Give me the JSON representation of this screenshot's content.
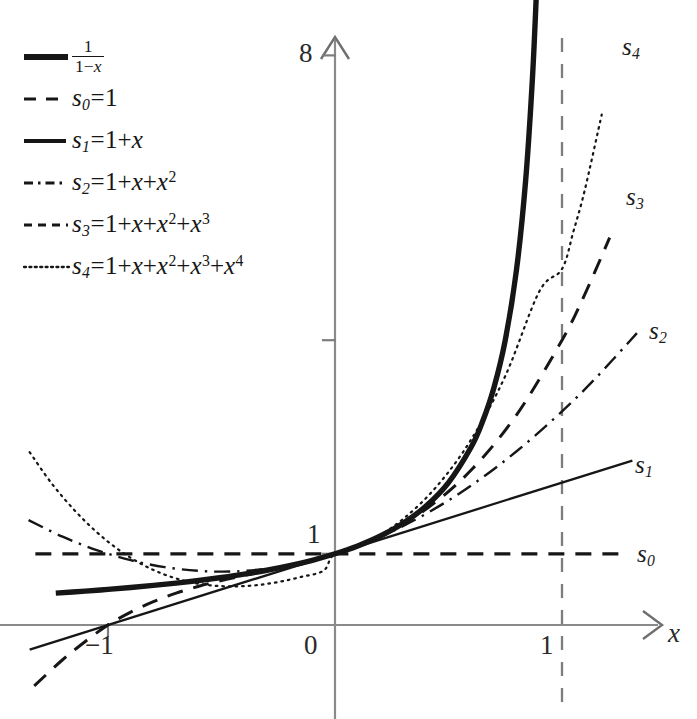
{
  "figure": {
    "title": "",
    "background": "#ffffff",
    "ink": "#161616",
    "axis_color": "#8a8a8a"
  },
  "legend": {
    "entries": [
      {
        "key": "f",
        "style": "solid-thick",
        "label_html": "<span class=\"frac\"><span class=\"num\">1</span><span class=\"den\">1&minus;<span class=\"mi\">x</span></span></span>"
      },
      {
        "key": "s0",
        "style": "dashed",
        "label_html": "<span class=\"mi\">s</span><span class=\"sub\">0</span><span class=\"eq\">=</span>1"
      },
      {
        "key": "s1",
        "style": "solid-thin",
        "label_html": "<span class=\"mi\">s</span><span class=\"sub\">1</span><span class=\"eq\">=</span>1+<span class=\"mi\">x</span>"
      },
      {
        "key": "s2",
        "style": "dashdot",
        "label_html": "<span class=\"mi\">s</span><span class=\"sub\">2</span><span class=\"eq\">=</span>1+<span class=\"mi\">x</span>+<span class=\"mi\">x</span><span class=\"sup\">2</span>"
      },
      {
        "key": "s3",
        "style": "dashed-short",
        "label_html": "<span class=\"mi\">s</span><span class=\"sub\">3</span><span class=\"eq\">=</span>1+<span class=\"mi\">x</span>+<span class=\"mi\">x</span><span class=\"sup\">2</span>+<span class=\"mi\">x</span><span class=\"sup\">3</span>"
      },
      {
        "key": "s4",
        "style": "dotted",
        "label_html": "<span class=\"mi\">s</span><span class=\"sub\">4</span><span class=\"eq\">=</span>1+<span class=\"mi\">x</span>+<span class=\"mi\">x</span><span class=\"sup\">2</span>+<span class=\"mi\">x</span><span class=\"sup\">3</span>+<span class=\"mi\">x</span><span class=\"sup\">4</span>"
      }
    ]
  },
  "axes": {
    "x_axis_label": "x",
    "y_tick_labels": [
      {
        "text": "8",
        "value": 8
      },
      {
        "text": "1",
        "value": 1
      }
    ],
    "x_tick_labels": [
      {
        "text": "-1",
        "value": -1
      },
      {
        "text": "0",
        "value": 0
      },
      {
        "text": "1",
        "value": 1
      }
    ],
    "y_unlabeled_ticks": [
      4
    ],
    "asymptote": {
      "at_x": 1,
      "style": "dashed",
      "label": ""
    }
  },
  "curve_end_labels": [
    {
      "key": "s4",
      "text_html": "<span class=\"mi\">s</span><span class=\"sub\">4</span>",
      "x": 622,
      "y": 34
    },
    {
      "key": "s3",
      "text_html": "<span class=\"mi\">s</span><span class=\"sub\">3</span>",
      "x": 626,
      "y": 184
    },
    {
      "key": "s2",
      "text_html": "<span class=\"mi\">s</span><span class=\"sub\">2</span>",
      "x": 649,
      "y": 318
    },
    {
      "key": "s1",
      "text_html": "<span class=\"mi\">s</span><span class=\"sub\">1</span>",
      "x": 635,
      "y": 452
    },
    {
      "key": "s0",
      "text_html": "<span class=\"mi\">s</span><span class=\"sub\">0</span>",
      "x": 637,
      "y": 541
    }
  ],
  "chart_data": {
    "type": "line",
    "xlabel": "x",
    "ylabel": "",
    "xlim": [
      -1.35,
      1.43
    ],
    "ylim": [
      -1.1,
      8.6
    ],
    "grid": false,
    "legend_position": "top-left",
    "x_ticks": [
      -1,
      0,
      1
    ],
    "y_ticks": [
      1,
      4,
      8
    ],
    "y_ticks_labeled": [
      1,
      8
    ],
    "annotations": [
      {
        "type": "vline",
        "x": 1,
        "style": "dashed",
        "note": "asymptote x=1"
      }
    ],
    "series": [
      {
        "name": "1/(1-x)",
        "expr": "1/(1-x)",
        "style": "solid",
        "width": 5.4,
        "color": "#161616",
        "x_range": [
          -1.23,
          0.888
        ],
        "points": [
          [
            -1.23,
            0.448
          ],
          [
            -1.1,
            0.476
          ],
          [
            -1.0,
            0.5
          ],
          [
            -0.9,
            0.526
          ],
          [
            -0.8,
            0.556
          ],
          [
            -0.7,
            0.588
          ],
          [
            -0.6,
            0.625
          ],
          [
            -0.5,
            0.667
          ],
          [
            -0.4,
            0.714
          ],
          [
            -0.3,
            0.769
          ],
          [
            -0.2,
            0.833
          ],
          [
            -0.1,
            0.909
          ],
          [
            0.0,
            1.0
          ],
          [
            0.1,
            1.111
          ],
          [
            0.2,
            1.25
          ],
          [
            0.3,
            1.429
          ],
          [
            0.4,
            1.667
          ],
          [
            0.5,
            2.0
          ],
          [
            0.6,
            2.5
          ],
          [
            0.65,
            2.857
          ],
          [
            0.7,
            3.333
          ],
          [
            0.75,
            4.0
          ],
          [
            0.8,
            5.0
          ],
          [
            0.84,
            6.25
          ],
          [
            0.87,
            7.692
          ],
          [
            0.888,
            8.93
          ]
        ]
      },
      {
        "name": "s0",
        "expr": "1",
        "style": "dashed",
        "width": 3.2,
        "color": "#161616",
        "x_range": [
          -1.32,
          1.28
        ],
        "points": [
          [
            -1.32,
            1
          ],
          [
            1.28,
            1
          ]
        ]
      },
      {
        "name": "s1",
        "expr": "1+x",
        "style": "solid",
        "width": 2.3,
        "color": "#161616",
        "x_range": [
          -1.345,
          1.31
        ],
        "points": [
          [
            -1.345,
            -0.345
          ],
          [
            1.31,
            2.31
          ]
        ]
      },
      {
        "name": "s2",
        "expr": "1+x+x^2",
        "style": "dashdot",
        "width": 2.4,
        "color": "#161616",
        "x_range": [
          -1.35,
          1.33
        ],
        "points": [
          [
            -1.35,
            1.4725
          ],
          [
            -1.2,
            1.24
          ],
          [
            -1.05,
            1.0525
          ],
          [
            -0.9,
            0.91
          ],
          [
            -0.75,
            0.8125
          ],
          [
            -0.6,
            0.76
          ],
          [
            -0.5,
            0.75
          ],
          [
            -0.4,
            0.76
          ],
          [
            -0.25,
            0.8125
          ],
          [
            -0.1,
            0.91
          ],
          [
            0.0,
            1.0
          ],
          [
            0.2,
            1.24
          ],
          [
            0.4,
            1.56
          ],
          [
            0.6,
            1.96
          ],
          [
            0.8,
            2.44
          ],
          [
            1.0,
            3.0
          ],
          [
            1.15,
            3.4725
          ],
          [
            1.33,
            4.0989
          ]
        ]
      },
      {
        "name": "s3",
        "expr": "1+x+x^2+x^3",
        "style": "dashed",
        "width": 3.0,
        "color": "#161616",
        "x_range": [
          -1.325,
          1.21
        ],
        "points": [
          [
            -1.325,
            -0.854
          ],
          [
            -1.2,
            -0.488
          ],
          [
            -1.1,
            -0.231
          ],
          [
            -1.0,
            0.0
          ],
          [
            -0.9,
            0.181
          ],
          [
            -0.8,
            0.328
          ],
          [
            -0.7,
            0.447
          ],
          [
            -0.6,
            0.544
          ],
          [
            -0.5,
            0.625
          ],
          [
            -0.4,
            0.696
          ],
          [
            -0.3,
            0.763
          ],
          [
            -0.2,
            0.832
          ],
          [
            -0.1,
            0.909
          ],
          [
            0.0,
            1.0
          ],
          [
            0.2,
            1.248
          ],
          [
            0.4,
            1.624
          ],
          [
            0.6,
            2.176
          ],
          [
            0.8,
            2.952
          ],
          [
            1.0,
            4.0
          ],
          [
            1.1,
            4.641
          ],
          [
            1.21,
            5.44
          ]
        ]
      },
      {
        "name": "s4",
        "expr": "1+x+x^2+x^3+x^4",
        "style": "dotted",
        "width": 2.2,
        "color": "#161616",
        "x_range": [
          -1.345,
          1.175
        ],
        "points": [
          [
            -1.345,
            2.426
          ],
          [
            -1.25,
            1.996
          ],
          [
            -1.15,
            1.62
          ],
          [
            -1.05,
            1.305
          ],
          [
            -0.95,
            1.05
          ],
          [
            -0.85,
            0.852
          ],
          [
            -0.75,
            0.707
          ],
          [
            -0.65,
            0.611
          ],
          [
            -0.55,
            0.557
          ],
          [
            -0.45,
            0.542
          ],
          [
            -0.35,
            0.558
          ],
          [
            -0.25,
            0.604
          ],
          [
            -0.15,
            0.675
          ],
          [
            -0.05,
            0.764
          ],
          [
            0.0,
            1.0
          ],
          [
            0.15,
            1.176
          ],
          [
            0.3,
            1.489
          ],
          [
            0.45,
            1.954
          ],
          [
            0.6,
            2.606
          ],
          [
            0.75,
            3.496
          ],
          [
            0.9,
            4.685
          ],
          [
            1.0,
            5.0
          ],
          [
            1.05,
            5.525
          ],
          [
            1.1,
            6.105
          ],
          [
            1.175,
            7.17
          ]
        ]
      }
    ]
  }
}
